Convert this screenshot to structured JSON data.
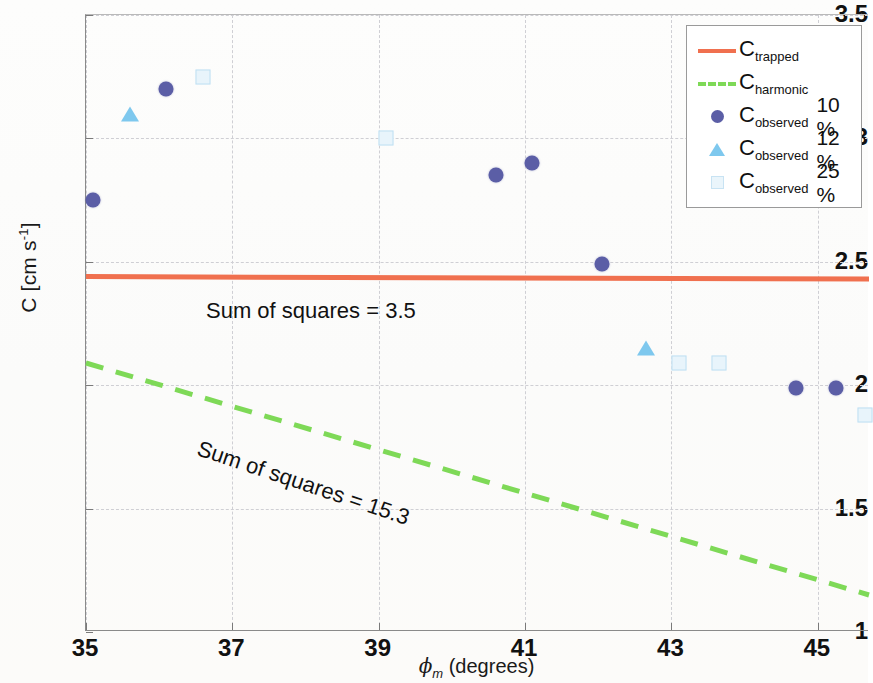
{
  "chart_data": {
    "type": "scatter",
    "title": "",
    "xlabel": "ϕ_m (degrees)",
    "ylabel": "C [cm s^-1]",
    "xlim": [
      35,
      45.7
    ],
    "ylim": [
      1,
      3.5
    ],
    "xticks": [
      "35",
      "37",
      "39",
      "41",
      "43",
      "45"
    ],
    "xtick_values": [
      35,
      37,
      39,
      41,
      43,
      45
    ],
    "yticks": [
      "1",
      "1.5",
      "2",
      "2.5",
      "3",
      "3.5"
    ],
    "ytick_values": [
      1,
      1.5,
      2,
      2.5,
      3,
      3.5
    ],
    "grid": true,
    "legend_position": "top-right",
    "series": [
      {
        "name": "C_trapped",
        "type": "line",
        "style": "solid",
        "color": "#f0704f",
        "x": [
          35,
          45.7
        ],
        "values": [
          2.44,
          2.43
        ]
      },
      {
        "name": "C_harmonic",
        "type": "line",
        "style": "dashed",
        "color": "#7ed957",
        "x": [
          35,
          45.7
        ],
        "values": [
          2.09,
          1.15
        ]
      },
      {
        "name": "C_observed 10 %",
        "type": "scatter",
        "marker": "circle",
        "color": "#5b5ea6",
        "x": [
          35.1,
          36.1,
          40.6,
          41.1,
          42.05,
          44.7,
          45.25
        ],
        "values": [
          2.75,
          3.2,
          2.85,
          2.9,
          2.49,
          1.99,
          1.99
        ]
      },
      {
        "name": "C_observed 12 %",
        "type": "scatter",
        "marker": "triangle",
        "color": "#7ec8ee",
        "x": [
          35.6,
          42.65
        ],
        "values": [
          3.1,
          2.15
        ]
      },
      {
        "name": "C_observed 25 %",
        "type": "scatter",
        "marker": "square",
        "color": "#cfe8f6",
        "x": [
          36.6,
          39.1,
          43.1,
          43.65,
          45.65
        ],
        "values": [
          3.25,
          3.0,
          2.09,
          2.09,
          1.88
        ]
      }
    ],
    "annotations": [
      {
        "text": "Sum of squares = 3.5",
        "x": 35.5,
        "y": 2.37,
        "rotation": 0
      },
      {
        "text": "Sum of squares = 15.3",
        "x": 35.4,
        "y": 1.86,
        "rotation": 18.5
      }
    ]
  },
  "axes": {
    "ylabel_main": "C [cm s",
    "ylabel_exp": "-1",
    "ylabel_close": "]",
    "xlabel_phi": "ϕ",
    "xlabel_sub": "m",
    "xlabel_rest": " (degrees)"
  },
  "legend": {
    "entries": [
      {
        "base": "C",
        "sub": "trapped",
        "suffix": "",
        "key": "line-solid",
        "color": "#f0704f"
      },
      {
        "base": "C",
        "sub": "harmonic",
        "suffix": "",
        "key": "line-dashed",
        "color": "#7ed957"
      },
      {
        "base": "C",
        "sub": "observed",
        "suffix": "10 %",
        "key": "marker-circle",
        "color": "#5b5ea6"
      },
      {
        "base": "C",
        "sub": "observed",
        "suffix": "12 %",
        "key": "marker-triangle",
        "color": "#7ec8ee"
      },
      {
        "base": "C",
        "sub": "observed",
        "suffix": "25 %",
        "key": "marker-square",
        "color": "#cfe8f6"
      }
    ]
  }
}
